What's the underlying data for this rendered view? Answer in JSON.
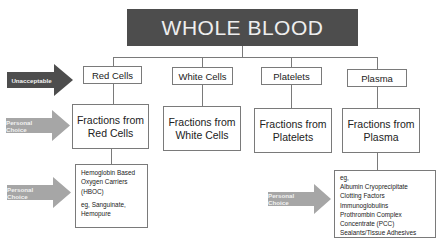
{
  "title": "WHOLE BLOOD",
  "components": [
    {
      "label": "Red Cells",
      "fraction_lines": [
        "Fractions from",
        "Red Cells"
      ]
    },
    {
      "label": "White Cells",
      "fraction_lines": [
        "Fractions from",
        "White Cells"
      ]
    },
    {
      "label": "Platelets",
      "fraction_lines": [
        "Fractions from",
        "Platelets"
      ]
    },
    {
      "label": "Plasma",
      "fraction_lines": [
        "Fractions from",
        "Plasma"
      ]
    }
  ],
  "red_cell_details": {
    "lines": [
      "Hemoglobin Based",
      "Oxygen Carriers",
      "(HBOC)"
    ],
    "example_lines": [
      "eg, Sanguinate,",
      "Hemopure"
    ]
  },
  "plasma_details": {
    "lines": [
      "eg,",
      "Albumin Cryoprecipitate",
      "Clotting Factors",
      "Immunoglobulins",
      "Prothrombin Complex",
      "Concentrate (PCC)",
      "Sealants/Tissue Adhesives"
    ]
  },
  "arrows": {
    "unacceptable": {
      "label": "Unacceptable",
      "color": "#4d4d4d"
    },
    "personal_choice_fractions": {
      "label": "Personal Choice",
      "color": "#a6a6a6"
    },
    "personal_choice_hboc": {
      "label": "Personal Choice",
      "color": "#a6a6a6"
    },
    "personal_choice_plasma": {
      "label": "Personal Choice",
      "color": "#a6a6a6"
    }
  }
}
